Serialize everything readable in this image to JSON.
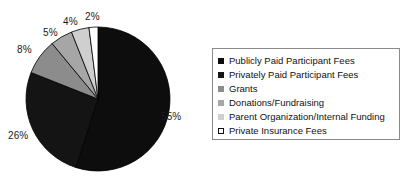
{
  "chart_data": {
    "type": "pie",
    "title": "",
    "subtitle": "",
    "xlabel": "",
    "ylabel": "",
    "grid": false,
    "legend_position": "right",
    "start_angle_deg": 0,
    "direction": "clockwise",
    "units": "percent",
    "categories": [
      "Publicly Paid Participant Fees",
      "Privately Paid Participant Fees",
      "Grants",
      "Donations/Fundraising",
      "Parent Organization/Internal Funding",
      "Private Insurance Fees"
    ],
    "values": [
      55,
      26,
      8,
      5,
      4,
      2
    ],
    "data_labels": [
      "55%",
      "26%",
      "8%",
      "5%",
      "4%",
      "2%"
    ],
    "colors": [
      "#0d0d0d",
      "#141414",
      "#8c8c8c",
      "#a6a6a6",
      "#cfcfcf",
      "#ffffff"
    ],
    "slice_edge_color": "#000000"
  },
  "legend": {
    "items": [
      {
        "label": "Publicly Paid Participant Fees",
        "color": "#0d0d0d",
        "swatch": "legend-swatch-filled"
      },
      {
        "label": "Privately Paid Participant Fees",
        "color": "#141414",
        "swatch": "legend-swatch-filled"
      },
      {
        "label": "Grants",
        "color": "#8c8c8c",
        "swatch": "legend-swatch-filled"
      },
      {
        "label": "Donations/Fundraising",
        "color": "#a6a6a6",
        "swatch": "legend-swatch-filled"
      },
      {
        "label": "Parent Organization/Internal Funding",
        "color": "#cfcfcf",
        "swatch": "legend-swatch-filled"
      },
      {
        "label": "Private Insurance Fees",
        "color": "#ffffff",
        "swatch": "legend-swatch-outlined"
      }
    ],
    "border_color": "#8a8a8a"
  },
  "labels": {
    "l0": "55%",
    "l1": "26%",
    "l2": "8%",
    "l3": "5%",
    "l4": "4%",
    "l5": "2%"
  }
}
